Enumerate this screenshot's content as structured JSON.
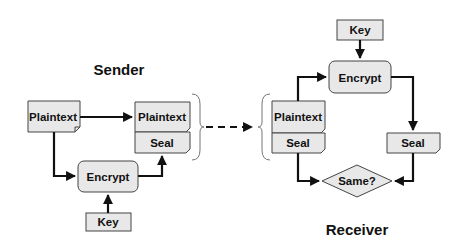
{
  "sender": {
    "title": "Sender",
    "plaintext_source": "Plaintext",
    "encrypt": "Encrypt",
    "key": "Key",
    "bundle": {
      "plaintext": "Plaintext",
      "seal": "Seal"
    }
  },
  "receiver": {
    "title": "Receiver",
    "key": "Key",
    "encrypt": "Encrypt",
    "bundle": {
      "plaintext": "Plaintext",
      "seal": "Seal"
    },
    "computed_seal": "Seal",
    "compare": "Same?"
  },
  "colors": {
    "shape_fill": "#e8e8e8",
    "shape_stroke": "#444444",
    "arrow": "#111111",
    "background": "#ffffff"
  }
}
